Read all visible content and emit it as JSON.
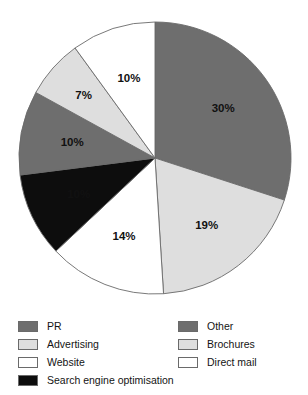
{
  "figure": {
    "title": "",
    "background": "#ffffff"
  },
  "colors": {
    "dark_gray": "#6e6e6e",
    "light_gray": "#dedede",
    "white": "#ffffff",
    "black": "#0d0d0d",
    "outline": "#6a6a6a",
    "label_dark": "#111111",
    "label_light": "#ffffff"
  },
  "chart_data": {
    "type": "pie",
    "title": "",
    "xlabel": "",
    "ylabel": "",
    "start_angle_deg": 0,
    "direction": "clockwise",
    "legend_position": "bottom",
    "grid": false,
    "categories": [
      "PR",
      "Advertising",
      "Website",
      "Search engine optimisation",
      "Other",
      "Brochures",
      "Direct mail"
    ],
    "values": [
      30,
      19,
      14,
      10,
      10,
      7,
      10
    ],
    "data_labels": [
      "30%",
      "19%",
      "14%",
      "10%",
      "10%",
      "7%",
      "10%"
    ],
    "slice_colors": [
      "#6e6e6e",
      "#dedede",
      "#ffffff",
      "#0d0d0d",
      "#6e6e6e",
      "#dedede",
      "#ffffff"
    ],
    "label_text_colors": [
      "#111111",
      "#111111",
      "#111111",
      "#ffffff",
      "#ffffff",
      "#111111",
      "#111111"
    ],
    "slices": [
      {
        "label": "PR",
        "value": 30,
        "display": "30%",
        "color": "#6e6e6e",
        "label_color": "#111111"
      },
      {
        "label": "Advertising",
        "value": 19,
        "display": "19%",
        "color": "#dedede",
        "label_color": "#111111"
      },
      {
        "label": "Website",
        "value": 14,
        "display": "14%",
        "color": "#ffffff",
        "label_color": "#111111"
      },
      {
        "label": "Search engine optimisation",
        "value": 10,
        "display": "10%",
        "color": "#0d0d0d",
        "label_color": "#ffffff"
      },
      {
        "label": "Other",
        "value": 10,
        "display": "10%",
        "color": "#6e6e6e",
        "label_color": "#ffffff"
      },
      {
        "label": "Brochures",
        "value": 7,
        "display": "7%",
        "color": "#dedede",
        "label_color": "#111111"
      },
      {
        "label": "Direct mail",
        "value": 10,
        "display": "10%",
        "color": "#ffffff",
        "label_color": "#111111"
      }
    ]
  },
  "legend": {
    "left_column": [
      {
        "label": "PR",
        "color": "#6e6e6e"
      },
      {
        "label": "Advertising",
        "color": "#dedede"
      },
      {
        "label": "Website",
        "color": "#ffffff"
      },
      {
        "label": "Search engine optimisation",
        "color": "#0d0d0d"
      }
    ],
    "right_column": [
      {
        "label": "Other",
        "color": "#6e6e6e"
      },
      {
        "label": "Brochures",
        "color": "#dedede"
      },
      {
        "label": "Direct mail",
        "color": "#ffffff"
      }
    ]
  }
}
